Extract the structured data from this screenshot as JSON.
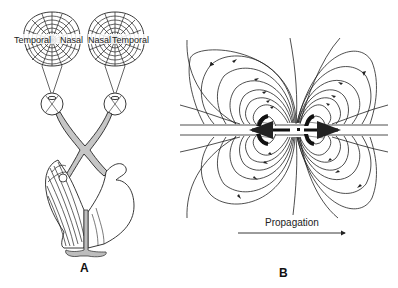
{
  "figure": {
    "panels": [
      {
        "id": "A",
        "letter": "A",
        "description": "Visual pathway with retinal field maps",
        "left_field": {
          "left_label": "Temporal",
          "right_label": "Nasal"
        },
        "right_field": {
          "left_label": "Nasal",
          "right_label": "Temporal"
        }
      },
      {
        "id": "B",
        "letter": "B",
        "description": "Dipole field lines around propagating wave",
        "propagation_label": "Propagation"
      }
    ]
  },
  "colors": {
    "line": "#222222",
    "gray_fill": "#bdbdbd",
    "background": "#ffffff"
  }
}
